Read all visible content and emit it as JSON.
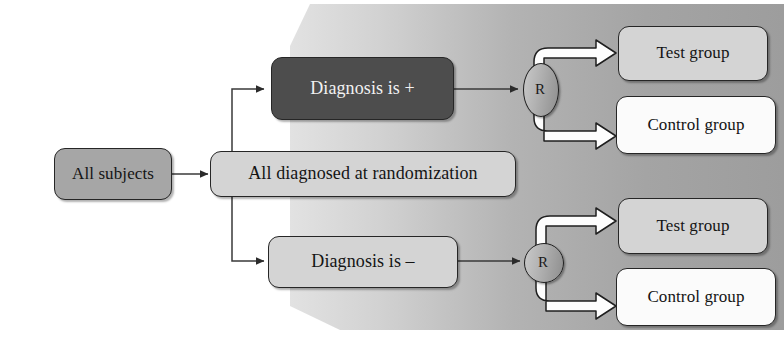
{
  "diagram": {
    "type": "flowchart",
    "colors": {
      "backdrop_gray": "#a8a8a8",
      "backdrop_gray_light": "#d9d9d9",
      "node_mid_gray": "#a6a6a6",
      "node_light_gray": "#d4d4d4",
      "node_dark_gray": "#4d4d4d",
      "node_white": "#fbfbfb",
      "outline": "#262626",
      "dark_text": "#141414",
      "light_text": "#f2f2f2"
    },
    "nodes": {
      "all_subjects": {
        "label": "All subjects",
        "fill": "mid"
      },
      "all_diagnosed": {
        "label": "All diagnosed at randomization",
        "fill": "light"
      },
      "diagnosis_positive": {
        "label": "Diagnosis is +",
        "fill": "dark"
      },
      "diagnosis_negative": {
        "label": "Diagnosis is –",
        "fill": "light"
      },
      "randomizer_positive": {
        "label": "R",
        "shape": "ellipse"
      },
      "randomizer_negative": {
        "label": "R",
        "shape": "circle"
      },
      "test_group_positive": {
        "label": "Test group",
        "fill": "light"
      },
      "control_group_positive": {
        "label": "Control group",
        "fill": "white"
      },
      "test_group_negative": {
        "label": "Test group",
        "fill": "light"
      },
      "control_group_negative": {
        "label": "Control group",
        "fill": "white"
      }
    },
    "edges": [
      {
        "from": "all_subjects",
        "to": "all_diagnosed",
        "style": "thin-arrow"
      },
      {
        "from": "all_diagnosed",
        "to": "diagnosis_positive",
        "style": "thin-elbow-arrow"
      },
      {
        "from": "all_diagnosed",
        "to": "diagnosis_negative",
        "style": "thin-elbow-arrow"
      },
      {
        "from": "diagnosis_positive",
        "to": "randomizer_positive",
        "style": "thin-arrow"
      },
      {
        "from": "diagnosis_negative",
        "to": "randomizer_negative",
        "style": "thin-arrow"
      },
      {
        "from": "randomizer_positive",
        "to": "test_group_positive",
        "style": "block-elbow-arrow"
      },
      {
        "from": "randomizer_positive",
        "to": "control_group_positive",
        "style": "block-elbow-arrow"
      },
      {
        "from": "randomizer_negative",
        "to": "test_group_negative",
        "style": "block-elbow-arrow"
      },
      {
        "from": "randomizer_negative",
        "to": "control_group_negative",
        "style": "block-elbow-arrow"
      }
    ]
  }
}
